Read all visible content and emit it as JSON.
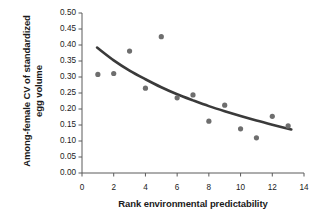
{
  "chart_data": {
    "type": "scatter",
    "title": "",
    "xlabel": "Rank environmental predictability",
    "ylabel": "Among-female CV of standardized egg volume",
    "ylabel_line1": "Among-female CV of standardized",
    "ylabel_line2": "egg volume",
    "xlim": [
      0,
      14
    ],
    "ylim": [
      0.0,
      0.5
    ],
    "xticks": [
      "0",
      "2",
      "4",
      "6",
      "8",
      "10",
      "12",
      "14"
    ],
    "xtick_values": [
      0,
      2,
      4,
      6,
      8,
      10,
      12,
      14
    ],
    "yticks": [
      "0.00",
      "0.05",
      "0.10",
      "0.15",
      "0.20",
      "0.25",
      "0.30",
      "0.35",
      "0.40",
      "0.45",
      "0.50"
    ],
    "ytick_values": [
      0.0,
      0.05,
      0.1,
      0.15,
      0.2,
      0.25,
      0.3,
      0.35,
      0.4,
      0.45,
      0.5
    ],
    "grid": false,
    "legend": "none",
    "x": [
      1,
      2,
      3,
      4,
      5,
      6,
      7,
      8,
      9,
      10,
      11,
      12,
      13
    ],
    "y": [
      0.308,
      0.311,
      0.381,
      0.265,
      0.426,
      0.235,
      0.244,
      0.162,
      0.212,
      0.138,
      0.11,
      0.177,
      0.147
    ],
    "series": [
      {
        "name": "Among-female CV of standardized egg volume",
        "marker": "circle",
        "color": "#6e6e6e",
        "points": [
          {
            "x": 1,
            "y": 0.308
          },
          {
            "x": 2,
            "y": 0.311
          },
          {
            "x": 3,
            "y": 0.381
          },
          {
            "x": 4,
            "y": 0.265
          },
          {
            "x": 5,
            "y": 0.426
          },
          {
            "x": 6,
            "y": 0.235
          },
          {
            "x": 7,
            "y": 0.244
          },
          {
            "x": 8,
            "y": 0.162
          },
          {
            "x": 9,
            "y": 0.212
          },
          {
            "x": 10,
            "y": 0.138
          },
          {
            "x": 11,
            "y": 0.11
          },
          {
            "x": 12,
            "y": 0.177
          },
          {
            "x": 13,
            "y": 0.147
          }
        ]
      }
    ],
    "fit_line": {
      "name": "fitted decreasing curve",
      "color": "#3a3a3a",
      "width": 2.6,
      "points": [
        {
          "x": 0.95,
          "y": 0.392
        },
        {
          "x": 2,
          "y": 0.352
        },
        {
          "x": 3,
          "y": 0.32
        },
        {
          "x": 4,
          "y": 0.293
        },
        {
          "x": 5,
          "y": 0.268
        },
        {
          "x": 6,
          "y": 0.246
        },
        {
          "x": 7,
          "y": 0.227
        },
        {
          "x": 8,
          "y": 0.209
        },
        {
          "x": 9,
          "y": 0.193
        },
        {
          "x": 10,
          "y": 0.178
        },
        {
          "x": 11,
          "y": 0.164
        },
        {
          "x": 12,
          "y": 0.151
        },
        {
          "x": 13.2,
          "y": 0.136
        }
      ]
    },
    "style": {
      "axis_color": "#5a5a5a",
      "marker_color": "#6e6e6e",
      "curve_color": "#3a3a3a",
      "background": "#ffffff",
      "text_color": "#1b1b1b"
    }
  }
}
